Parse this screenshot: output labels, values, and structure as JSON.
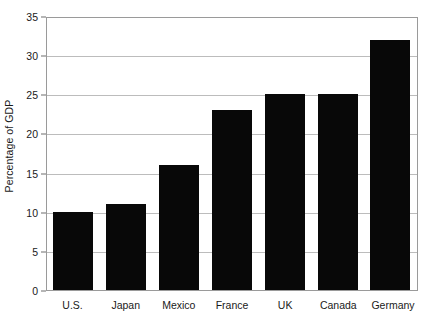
{
  "chart_data": {
    "type": "bar",
    "title": "",
    "xlabel": "",
    "ylabel": "Percentage of GDP",
    "categories": [
      "U.S.",
      "Japan",
      "Mexico",
      "France",
      "UK",
      "Canada",
      "Germany"
    ],
    "values": [
      10,
      11,
      16,
      23,
      25,
      25,
      32
    ],
    "ylim": [
      0,
      35
    ],
    "ytick_values": [
      0,
      5,
      10,
      15,
      20,
      25,
      30,
      35
    ],
    "ytick_labels": [
      "0",
      "5",
      "10",
      "15",
      "20",
      "25",
      "30",
      "35"
    ],
    "grid": true,
    "grid_axis": "y",
    "legend": false,
    "legend_position": "none",
    "bar_color": "#080808",
    "grid_color": "#bcbcbc",
    "axis_color": "#9a9a9a",
    "text_color": "#1a1a1a",
    "background_color": "#ffffff"
  }
}
